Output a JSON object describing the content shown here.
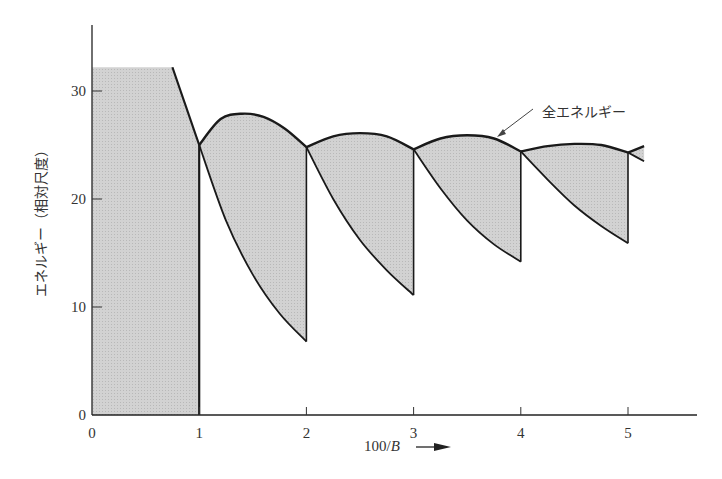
{
  "chart_data": {
    "type": "area",
    "title": "",
    "xlabel": "100/B",
    "xlabel_arrow": "→",
    "ylabel": "エネルギー（相対尺度）",
    "xlim": [
      0,
      5.6
    ],
    "ylim": [
      0,
      35
    ],
    "x_ticks": [
      0,
      1,
      2,
      3,
      4,
      5
    ],
    "y_ticks": [
      0,
      10,
      20,
      30
    ],
    "grid": false,
    "fill_color": "#cccccc",
    "line_color": "#1a1a1a",
    "annotation": {
      "text": "全エネルギー",
      "points_to": {
        "x": 3.77,
        "y": 25.9
      }
    },
    "series": [
      {
        "name": "全エネルギー (upper envelope)",
        "points": [
          [
            0,
            32.2
          ],
          [
            0.75,
            32.2
          ],
          [
            1.0,
            25.0
          ],
          [
            1.2,
            27.4
          ],
          [
            1.4,
            27.9
          ],
          [
            1.6,
            27.6
          ],
          [
            1.8,
            26.5
          ],
          [
            2.0,
            24.8
          ],
          [
            2.25,
            25.8
          ],
          [
            2.5,
            26.1
          ],
          [
            2.75,
            25.8
          ],
          [
            3.0,
            24.6
          ],
          [
            3.25,
            25.6
          ],
          [
            3.5,
            25.9
          ],
          [
            3.75,
            25.6
          ],
          [
            4.0,
            24.4
          ],
          [
            4.25,
            24.9
          ],
          [
            4.5,
            25.1
          ],
          [
            4.75,
            25.0
          ],
          [
            5.0,
            24.3
          ],
          [
            5.15,
            24.9
          ]
        ]
      },
      {
        "name": "lower branch",
        "segments": [
          {
            "x_range": [
              1,
              2
            ],
            "points": [
              [
                1.0,
                25.0
              ],
              [
                1.25,
                18.0
              ],
              [
                1.5,
                13.0
              ],
              [
                1.75,
                9.4
              ],
              [
                2.0,
                6.8
              ]
            ]
          },
          {
            "x_range": [
              2,
              3
            ],
            "points": [
              [
                2.0,
                24.8
              ],
              [
                2.25,
                20.0
              ],
              [
                2.5,
                16.2
              ],
              [
                2.75,
                13.4
              ],
              [
                3.0,
                11.1
              ]
            ]
          },
          {
            "x_range": [
              3,
              4
            ],
            "points": [
              [
                3.0,
                24.6
              ],
              [
                3.25,
                21.0
              ],
              [
                3.5,
                18.0
              ],
              [
                3.75,
                15.8
              ],
              [
                4.0,
                14.2
              ]
            ]
          },
          {
            "x_range": [
              4,
              5
            ],
            "points": [
              [
                4.0,
                24.4
              ],
              [
                4.25,
                21.8
              ],
              [
                4.5,
                19.4
              ],
              [
                4.75,
                17.5
              ],
              [
                5.0,
                15.9
              ]
            ]
          },
          {
            "x_range": [
              5,
              5.15
            ],
            "points": [
              [
                5.0,
                24.3
              ],
              [
                5.15,
                23.5
              ]
            ]
          }
        ]
      }
    ]
  },
  "labels": {
    "x_ticks": [
      "0",
      "1",
      "2",
      "3",
      "4",
      "5"
    ],
    "y_ticks": [
      "0",
      "10",
      "20",
      "30"
    ],
    "xlabel_prefix": "100/",
    "xlabel_var": "B",
    "ylabel": "エネルギー（相対尺度）",
    "annotation": "全エネルギー"
  }
}
